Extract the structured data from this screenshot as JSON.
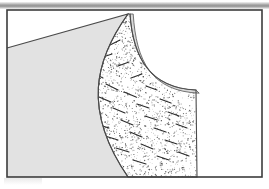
{
  "figure": {
    "kind": "technical-cross-section-illustration",
    "title_text": "",
    "caption_text": "",
    "labels": [],
    "axis_labels": [],
    "tick_labels": [],
    "legend": [],
    "annotations": []
  },
  "colors": {
    "page_background": "#ffffff",
    "frame_stroke": "#3c3c3c",
    "frame_interior": "#ffffff",
    "solid_mass_fill": "#e2e2e2",
    "solid_mass_stroke": "#4a4a4a",
    "stipple_dot": "#3a3a3a",
    "stipple_background": "#ffffff",
    "fiber_stroke": "#2b2b2b",
    "rim_band_fill": "#d9d9d9",
    "rim_band_stroke": "#555555",
    "top_rule_light": "#f3f3f3",
    "top_rule_dark": "#9a9a9a",
    "scan_artifact": "#b8b8b8"
  },
  "geometry": {
    "canvas": {
      "width": 269,
      "height": 189
    },
    "top_rule": {
      "x": 0,
      "y": 2,
      "width": 269,
      "height": 7
    },
    "frame": {
      "x": 7,
      "y": 10,
      "width": 255,
      "height": 167,
      "stroke_width": 1.6
    },
    "solid_mass": {
      "description": "light-gray homogeneous body at lower-left, bounded above by a straight inclined surface and at right by a concave-left curve",
      "surface_line": {
        "x1": 7,
        "y1": 48,
        "x2": 128,
        "y2": 14
      },
      "right_boundary_curve": {
        "start": [
          128,
          14
        ],
        "c1": [
          95,
          60
        ],
        "c2": [
          82,
          110
        ],
        "end": [
          128,
          177
        ]
      }
    },
    "stipple_body": {
      "description": "stippled granular layer with short dark fiber inclusions",
      "left_boundary_curve": {
        "start": [
          128,
          14
        ],
        "c1": [
          95,
          60
        ],
        "c2": [
          82,
          110
        ],
        "end": [
          128,
          177
        ]
      },
      "bottom_edge": {
        "x1": 128,
        "y1": 177,
        "x2": 197,
        "y2": 177
      },
      "right_edge": {
        "x1": 197,
        "y1": 177,
        "x2": 196,
        "y2": 90
      },
      "inner_concave_curve": {
        "start": [
          196,
          90
        ],
        "c1": [
          150,
          88
        ],
        "c2": [
          133,
          58
        ],
        "end": [
          130,
          14
        ]
      }
    },
    "rim_band": {
      "description": "narrow light band tracing the concave inner curve and right edge of the stippled body",
      "thickness": 3.2
    },
    "scan_artifact": {
      "x": 4,
      "y": 178,
      "width": 38,
      "height": 7
    }
  },
  "stipple": {
    "dot_count": 2600,
    "dot_radius_min": 0.28,
    "dot_radius_max": 0.72,
    "seed": 20519
  },
  "fibers": {
    "count": 34,
    "length_min": 7,
    "length_max": 18,
    "stroke_width": 1.1,
    "segments": [
      [
        76,
        44,
        88,
        51
      ],
      [
        96,
        38,
        106,
        33
      ],
      [
        86,
        55,
        98,
        62
      ],
      [
        110,
        45,
        120,
        40
      ],
      [
        70,
        62,
        82,
        66
      ],
      [
        100,
        58,
        112,
        54
      ],
      [
        64,
        76,
        78,
        80
      ],
      [
        91,
        72,
        103,
        78
      ],
      [
        118,
        66,
        129,
        62
      ],
      [
        82,
        88,
        95,
        92
      ],
      [
        106,
        84,
        118,
        90
      ],
      [
        131,
        78,
        142,
        74
      ],
      [
        75,
        100,
        88,
        104
      ],
      [
        99,
        97,
        111,
        102
      ],
      [
        124,
        92,
        136,
        97
      ],
      [
        146,
        86,
        157,
        90
      ],
      [
        88,
        112,
        101,
        116
      ],
      [
        113,
        108,
        125,
        113
      ],
      [
        137,
        104,
        149,
        108
      ],
      [
        160,
        99,
        171,
        103
      ],
      [
        96,
        124,
        109,
        128
      ],
      [
        121,
        120,
        133,
        125
      ],
      [
        145,
        116,
        157,
        120
      ],
      [
        168,
        112,
        179,
        116
      ],
      [
        105,
        136,
        118,
        140
      ],
      [
        130,
        132,
        142,
        137
      ],
      [
        154,
        128,
        166,
        132
      ],
      [
        176,
        124,
        187,
        128
      ],
      [
        116,
        148,
        129,
        152
      ],
      [
        141,
        144,
        153,
        149
      ],
      [
        165,
        140,
        177,
        144
      ],
      [
        133,
        160,
        146,
        164
      ],
      [
        157,
        156,
        169,
        160
      ],
      [
        178,
        152,
        189,
        156
      ]
    ]
  }
}
